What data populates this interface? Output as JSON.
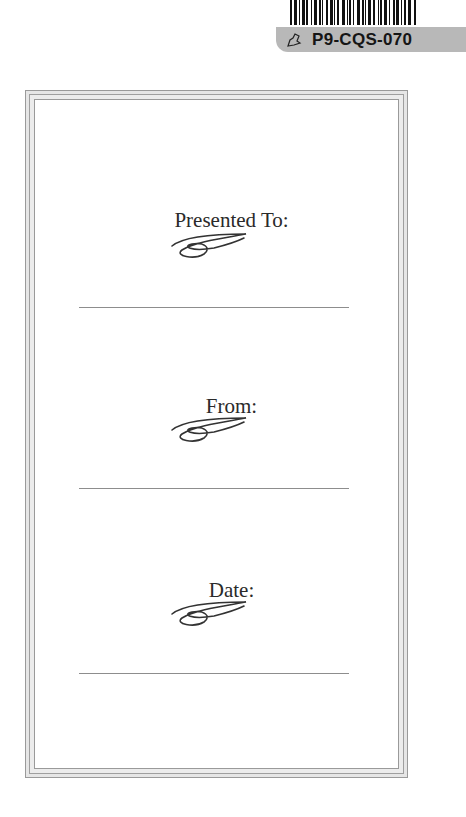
{
  "sticker": {
    "barcode_label": "P9-CQS-070",
    "icon": "tag-icon",
    "label_color": "#b8b8b8"
  },
  "certificate": {
    "frame_color": "#9a9a9a",
    "fields": [
      {
        "label": "Presented To:",
        "ornament": "flourish-icon"
      },
      {
        "label": "From:",
        "ornament": "flourish-icon"
      },
      {
        "label": "Date:",
        "ornament": "flourish-icon"
      }
    ]
  }
}
